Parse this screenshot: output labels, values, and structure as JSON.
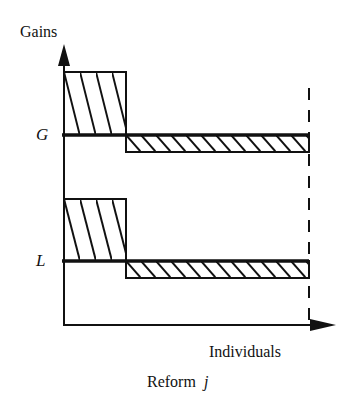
{
  "figure": {
    "y_axis_label": "Gains",
    "x_axis_label": "Individuals",
    "caption_prefix": "Reform",
    "caption_var": "j",
    "panels": [
      {
        "label": "G",
        "description": "Gains: large gain for few individuals, small loss for many"
      },
      {
        "label": "L",
        "description": "Losses: same pattern as G"
      }
    ]
  },
  "colors": {
    "ink": "#111111",
    "background": "#ffffff"
  }
}
